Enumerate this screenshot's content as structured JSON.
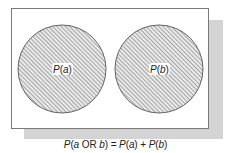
{
  "diagram": {
    "type": "venn-mutually-exclusive",
    "sets": [
      {
        "id": "a",
        "label_prefix": "P(",
        "label_var": "a",
        "label_suffix": ")",
        "label": "P(a)"
      },
      {
        "id": "b",
        "label_prefix": "P(",
        "label_var": "b",
        "label_suffix": ")",
        "label": "P(b)"
      }
    ],
    "overlap": false,
    "fill": "diagonal-hatch"
  },
  "caption": {
    "full": "P(a OR b) = P(a) + P(b)",
    "parts": {
      "p1": "P",
      "open1": "(",
      "a1": "a",
      "or": " OR ",
      "b1": "b",
      "close1": ")",
      "eq": " = ",
      "p2": "P",
      "open2": "(",
      "a2": "a",
      "close2": ")",
      "plus": " + ",
      "p3": "P",
      "open3": "(",
      "b2": "b",
      "close3": ")"
    }
  },
  "colors": {
    "frame_border": "#7a7a7a",
    "shadow": "#d4d4d4",
    "hatch_line": "#6e6e6e",
    "circle_outline": "#555555",
    "text": "#222222"
  }
}
